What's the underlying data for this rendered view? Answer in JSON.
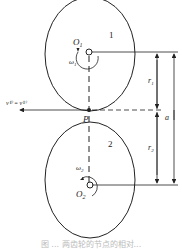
{
  "diagram": {
    "gear1": {
      "label": "1",
      "center_label": "O",
      "center_sub": "1",
      "omega_label": "ω",
      "omega_sub": "1",
      "radius_label": "r",
      "radius_sub": "1"
    },
    "gear2": {
      "label": "2",
      "center_label": "O",
      "center_sub": "2",
      "omega_label": "ω",
      "omega_sub": "2",
      "radius_label": "r",
      "radius_sub": "2"
    },
    "pitch_point": "P",
    "velocity_label": "v⁽¹⁾ = v⁽²⁾",
    "center_distance_label": "a",
    "caption": "图 ... 两齿轮的节点的相对..."
  },
  "colors": {
    "stroke": "#222222",
    "background": "#ffffff"
  }
}
